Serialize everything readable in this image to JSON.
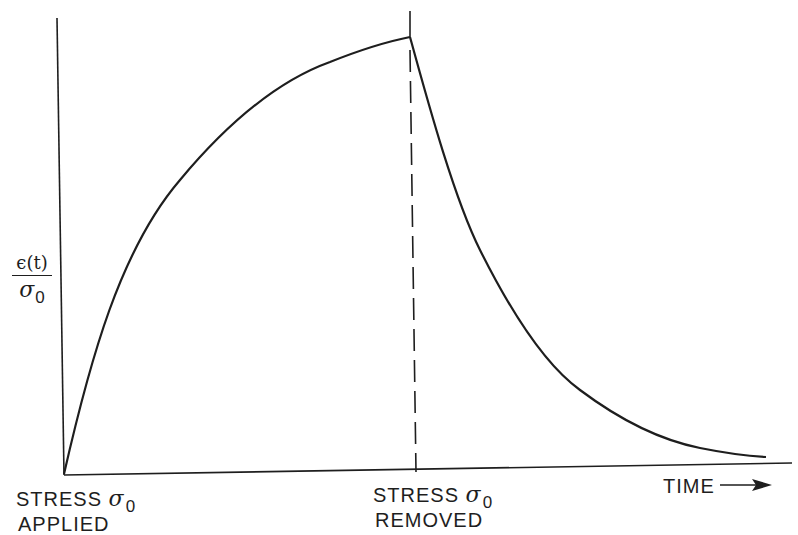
{
  "diagram": {
    "type": "creep-recovery curve",
    "y_axis_label": {
      "numerator": "ϵ(t)",
      "denominator_symbol": "σ",
      "denominator_subscript": "0"
    },
    "x_axis_label": "TIME",
    "x_axis_arrow": "→",
    "annotations": [
      {
        "line1": "STRESS",
        "symbol": "σ",
        "subscript": "0",
        "line2": "APPLIED"
      },
      {
        "line1": "STRESS",
        "symbol": "σ",
        "subscript": "0",
        "line2": "REMOVED"
      }
    ],
    "curves": [
      {
        "name": "creep",
        "description": "rises rapidly from origin, concave-down, approaching plateau until stress removed"
      },
      {
        "name": "recovery",
        "description": "decays from peak toward zero after stress removed"
      }
    ],
    "line_color": "#1e1e1e",
    "background_color": "#ffffff"
  }
}
